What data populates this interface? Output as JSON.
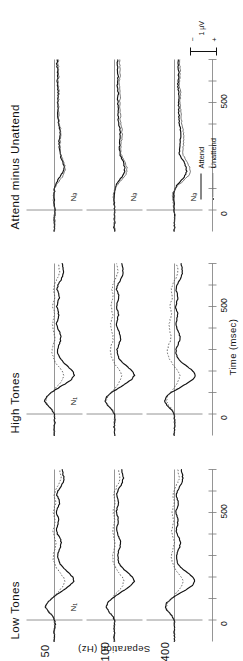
{
  "figure": {
    "title": "",
    "columns": [
      {
        "key": "low",
        "label": "Low Tones"
      },
      {
        "key": "high",
        "label": "High Tones"
      },
      {
        "key": "diff",
        "label": "Attend minus Unattend"
      }
    ],
    "row_axis_label": "Separation (Hz)",
    "rows": [
      {
        "key": "sep50",
        "label": "50"
      },
      {
        "key": "sep100",
        "label": "100"
      },
      {
        "key": "sep400",
        "label": "400"
      }
    ],
    "time_axis": {
      "label": "Time (msec)",
      "tick_labels": [
        "0",
        "500"
      ],
      "tick_values": [
        0,
        500
      ],
      "range": [
        -100,
        700
      ],
      "minor_tick_step": 100
    },
    "legend": {
      "position": "bottom-right",
      "items": [
        {
          "label": "Attend",
          "style": "solid"
        },
        {
          "label": "Unattend",
          "style": "dotted"
        }
      ]
    },
    "scale_bar": {
      "label": "1 µV",
      "plus": "+",
      "minus": "−"
    },
    "annotations": {
      "tone_component": "N₁",
      "diff_component": "Nₔ"
    },
    "colors": {
      "attend": "#111111",
      "unattend": "#555555",
      "axis": "#7a7a7a",
      "text": "#111111",
      "background": "#ffffff"
    }
  },
  "chart_data": {
    "type": "line",
    "xlabel": "Time (msec)",
    "ylabel": "Separation (Hz)",
    "xlim": [
      -100,
      700
    ],
    "ylim": [
      -4,
      4
    ],
    "grid": false,
    "legend": [
      "Attend",
      "Unattend"
    ],
    "legend_position": "bottom-right",
    "x_tick_labels": [
      "0",
      "500"
    ],
    "x_tick_values": [
      0,
      500
    ],
    "x": [
      -100,
      -80,
      -60,
      -40,
      -20,
      0,
      20,
      40,
      60,
      80,
      100,
      120,
      140,
      160,
      180,
      200,
      220,
      240,
      260,
      280,
      300,
      320,
      340,
      360,
      380,
      400,
      420,
      440,
      460,
      480,
      500,
      520,
      540,
      560,
      580,
      600,
      620,
      640,
      660,
      680,
      700
    ],
    "panels": [
      {
        "column": "Low Tones",
        "row": "50",
        "annotation": "N1",
        "series": [
          {
            "name": "Attend",
            "values": [
              0.05,
              -0.05,
              0.1,
              0.0,
              -0.1,
              0.0,
              0.35,
              0.9,
              1.3,
              1.05,
              0.4,
              -0.4,
              -1.3,
              -2.2,
              -2.75,
              -2.6,
              -2.0,
              -1.3,
              -0.8,
              -0.55,
              -0.45,
              -0.6,
              -0.85,
              -1.0,
              -0.8,
              -0.45,
              -0.3,
              -0.45,
              -0.6,
              -0.5,
              -0.3,
              -0.45,
              -0.7,
              -0.6,
              -0.35,
              -0.5,
              -0.9,
              -1.2,
              -1.35,
              -1.2,
              -1.1
            ]
          },
          {
            "name": "Unattend",
            "values": [
              0.0,
              0.05,
              0.0,
              -0.05,
              0.0,
              0.05,
              0.3,
              0.85,
              1.25,
              1.0,
              0.45,
              -0.2,
              -0.8,
              -1.3,
              -1.5,
              -1.25,
              -0.8,
              -0.35,
              -0.05,
              0.15,
              0.2,
              0.05,
              -0.15,
              -0.2,
              -0.05,
              0.15,
              0.2,
              0.05,
              -0.1,
              0.0,
              0.15,
              0.05,
              -0.15,
              -0.1,
              0.05,
              -0.1,
              -0.4,
              -0.75,
              -0.95,
              -0.85,
              -0.75
            ]
          }
        ]
      },
      {
        "column": "Low Tones",
        "row": "100",
        "annotation": "",
        "series": [
          {
            "name": "Attend",
            "values": [
              0.0,
              0.05,
              -0.05,
              0.05,
              0.0,
              0.0,
              0.3,
              0.85,
              1.2,
              1.0,
              0.35,
              -0.5,
              -1.45,
              -2.35,
              -2.8,
              -2.55,
              -1.9,
              -1.2,
              -0.7,
              -0.5,
              -0.45,
              -0.6,
              -0.8,
              -0.9,
              -0.7,
              -0.4,
              -0.3,
              -0.45,
              -0.55,
              -0.45,
              -0.25,
              -0.4,
              -0.6,
              -0.5,
              -0.3,
              -0.45,
              -0.8,
              -1.1,
              -1.25,
              -1.15,
              -1.05
            ]
          },
          {
            "name": "Unattend",
            "values": [
              0.0,
              0.0,
              0.05,
              0.0,
              -0.05,
              0.05,
              0.25,
              0.8,
              1.15,
              0.95,
              0.4,
              -0.15,
              -0.7,
              -1.15,
              -1.35,
              -1.1,
              -0.6,
              -0.2,
              0.05,
              0.25,
              0.3,
              0.15,
              -0.05,
              -0.1,
              0.05,
              0.2,
              0.25,
              0.1,
              -0.05,
              0.05,
              0.2,
              0.1,
              -0.1,
              -0.05,
              0.1,
              -0.05,
              -0.3,
              -0.6,
              -0.8,
              -0.7,
              -0.6
            ]
          }
        ]
      },
      {
        "column": "Low Tones",
        "row": "400",
        "annotation": "",
        "series": [
          {
            "name": "Attend",
            "values": [
              0.05,
              0.0,
              0.05,
              -0.05,
              0.0,
              0.05,
              0.35,
              0.95,
              1.35,
              1.1,
              0.4,
              -0.55,
              -1.6,
              -2.5,
              -2.9,
              -2.6,
              -1.85,
              -1.05,
              -0.5,
              -0.3,
              -0.3,
              -0.5,
              -0.75,
              -0.85,
              -0.65,
              -0.35,
              -0.25,
              -0.4,
              -0.5,
              -0.4,
              -0.2,
              -0.35,
              -0.55,
              -0.45,
              -0.25,
              -0.4,
              -0.75,
              -1.05,
              -1.2,
              -1.1,
              -1.0
            ]
          },
          {
            "name": "Unattend",
            "values": [
              0.0,
              0.05,
              0.0,
              0.0,
              -0.05,
              0.0,
              0.3,
              0.85,
              1.2,
              1.0,
              0.45,
              -0.1,
              -0.6,
              -1.0,
              -1.2,
              -0.95,
              -0.45,
              -0.05,
              0.2,
              0.4,
              0.45,
              0.3,
              0.1,
              0.05,
              0.2,
              0.35,
              0.4,
              0.25,
              0.1,
              0.2,
              0.35,
              0.25,
              0.05,
              0.1,
              0.25,
              0.1,
              -0.15,
              -0.45,
              -0.65,
              -0.55,
              -0.45
            ]
          }
        ]
      },
      {
        "column": "High Tones",
        "row": "50",
        "annotation": "N1",
        "series": [
          {
            "name": "Attend",
            "values": [
              0.0,
              0.05,
              0.0,
              -0.05,
              0.0,
              0.05,
              0.4,
              1.0,
              1.4,
              1.15,
              0.45,
              -0.5,
              -1.5,
              -2.4,
              -2.85,
              -2.6,
              -1.95,
              -1.25,
              -0.75,
              -0.5,
              -0.45,
              -0.6,
              -0.85,
              -0.95,
              -0.75,
              -0.4,
              -0.3,
              -0.45,
              -0.6,
              -0.5,
              -0.3,
              -0.45,
              -0.7,
              -0.6,
              -0.35,
              -0.5,
              -0.85,
              -1.15,
              -1.3,
              -1.2,
              -1.1
            ]
          },
          {
            "name": "Unattend",
            "values": [
              0.05,
              0.0,
              0.05,
              0.0,
              -0.05,
              0.05,
              0.3,
              0.85,
              1.25,
              1.0,
              0.45,
              -0.15,
              -0.7,
              -1.15,
              -1.35,
              -1.1,
              -0.6,
              -0.15,
              0.1,
              0.3,
              0.35,
              0.2,
              0.0,
              -0.05,
              0.1,
              0.25,
              0.3,
              0.15,
              0.0,
              0.1,
              0.25,
              0.15,
              -0.05,
              0.0,
              0.15,
              0.0,
              -0.25,
              -0.55,
              -0.75,
              -0.65,
              -0.55
            ]
          }
        ]
      },
      {
        "column": "High Tones",
        "row": "100",
        "annotation": "",
        "series": [
          {
            "name": "Attend",
            "values": [
              0.0,
              0.0,
              0.05,
              0.0,
              -0.05,
              0.0,
              0.35,
              0.95,
              1.35,
              1.1,
              0.4,
              -0.55,
              -1.55,
              -2.45,
              -2.85,
              -2.55,
              -1.85,
              -1.1,
              -0.6,
              -0.4,
              -0.35,
              -0.55,
              -0.8,
              -0.9,
              -0.7,
              -0.4,
              -0.3,
              -0.45,
              -0.55,
              -0.45,
              -0.25,
              -0.4,
              -0.65,
              -0.55,
              -0.3,
              -0.45,
              -0.8,
              -1.1,
              -1.25,
              -1.15,
              -1.05
            ]
          },
          {
            "name": "Unattend",
            "values": [
              0.0,
              0.05,
              0.0,
              0.05,
              0.0,
              0.0,
              0.3,
              0.85,
              1.2,
              1.0,
              0.5,
              -0.05,
              -0.5,
              -0.85,
              -1.05,
              -0.8,
              -0.3,
              0.1,
              0.35,
              0.55,
              0.6,
              0.45,
              0.25,
              0.2,
              0.35,
              0.5,
              0.55,
              0.4,
              0.25,
              0.35,
              0.5,
              0.4,
              0.2,
              0.25,
              0.4,
              0.25,
              0.0,
              -0.3,
              -0.5,
              -0.4,
              -0.3
            ]
          }
        ]
      },
      {
        "column": "High Tones",
        "row": "400",
        "annotation": "",
        "series": [
          {
            "name": "Attend",
            "values": [
              0.05,
              0.0,
              0.0,
              -0.05,
              0.0,
              0.05,
              0.4,
              1.05,
              1.45,
              1.2,
              0.45,
              -0.6,
              -1.7,
              -2.6,
              -3.0,
              -2.65,
              -1.85,
              -1.0,
              -0.45,
              -0.25,
              -0.25,
              -0.45,
              -0.7,
              -0.8,
              -0.6,
              -0.3,
              -0.2,
              -0.35,
              -0.45,
              -0.35,
              -0.15,
              -0.3,
              -0.5,
              -0.4,
              -0.2,
              -0.35,
              -0.7,
              -1.0,
              -1.15,
              -1.05,
              -0.95
            ]
          },
          {
            "name": "Unattend",
            "values": [
              0.0,
              0.0,
              0.05,
              0.0,
              0.0,
              0.0,
              0.3,
              0.85,
              1.2,
              1.0,
              0.55,
              0.1,
              -0.3,
              -0.6,
              -0.75,
              -0.5,
              0.0,
              0.45,
              0.75,
              0.95,
              1.0,
              0.85,
              0.6,
              0.5,
              0.6,
              0.75,
              0.8,
              0.6,
              0.4,
              0.5,
              0.65,
              0.5,
              0.3,
              0.35,
              0.5,
              0.3,
              0.0,
              -0.3,
              -0.5,
              -0.4,
              -0.3
            ]
          }
        ]
      },
      {
        "column": "Attend minus Unattend",
        "row": "50",
        "annotation": "Nd",
        "series": [
          {
            "name": "Low",
            "values": [
              0.05,
              -0.05,
              0.1,
              0.05,
              -0.05,
              -0.05,
              0.05,
              0.05,
              0.05,
              0.05,
              -0.05,
              -0.2,
              -0.5,
              -0.9,
              -1.25,
              -1.35,
              -1.2,
              -0.95,
              -0.85,
              -0.7,
              -0.65,
              -0.65,
              -0.7,
              -0.8,
              -0.75,
              -0.6,
              -0.5,
              -0.5,
              -0.5,
              -0.5,
              -0.45,
              -0.5,
              -0.55,
              -0.5,
              -0.4,
              -0.4,
              -0.5,
              -0.45,
              -0.4,
              -0.35,
              -0.35
            ]
          },
          {
            "name": "High",
            "values": [
              -0.05,
              0.05,
              -0.05,
              -0.05,
              0.05,
              0.0,
              0.1,
              0.15,
              0.15,
              0.15,
              0.0,
              -0.35,
              -0.8,
              -1.25,
              -1.5,
              -1.5,
              -1.35,
              -1.1,
              -0.85,
              -0.8,
              -0.8,
              -0.8,
              -0.85,
              -0.9,
              -0.85,
              -0.65,
              -0.6,
              -0.6,
              -0.6,
              -0.6,
              -0.55,
              -0.6,
              -0.65,
              -0.6,
              -0.5,
              -0.5,
              -0.6,
              -0.6,
              -0.55,
              -0.55,
              -0.55
            ]
          }
        ]
      },
      {
        "column": "Attend minus Unattend",
        "row": "100",
        "annotation": "Nd",
        "series": [
          {
            "name": "Low",
            "values": [
              0.0,
              0.05,
              -0.05,
              0.05,
              0.0,
              -0.05,
              0.05,
              0.05,
              0.05,
              0.05,
              -0.05,
              -0.35,
              -0.75,
              -1.2,
              -1.45,
              -1.45,
              -1.3,
              -1.0,
              -0.75,
              -0.75,
              -0.75,
              -0.75,
              -0.75,
              -0.8,
              -0.75,
              -0.6,
              -0.55,
              -0.55,
              -0.5,
              -0.5,
              -0.45,
              -0.5,
              -0.5,
              -0.45,
              -0.4,
              -0.4,
              -0.5,
              -0.5,
              -0.45,
              -0.45,
              -0.45
            ]
          },
          {
            "name": "High",
            "values": [
              0.0,
              -0.05,
              0.05,
              0.0,
              -0.05,
              0.0,
              0.05,
              0.1,
              0.15,
              0.1,
              -0.1,
              -0.5,
              -1.05,
              -1.6,
              -1.8,
              -1.75,
              -1.55,
              -1.2,
              -0.95,
              -0.95,
              -0.95,
              -1.0,
              -1.05,
              -1.1,
              -1.05,
              -0.9,
              -0.85,
              -0.85,
              -0.8,
              -0.8,
              -0.75,
              -0.8,
              -0.85,
              -0.8,
              -0.7,
              -0.7,
              -0.8,
              -0.8,
              -0.75,
              -0.75,
              -0.75
            ]
          }
        ]
      },
      {
        "column": "Attend minus Unattend",
        "row": "400",
        "annotation": "Nd",
        "series": [
          {
            "name": "Low",
            "values": [
              0.05,
              0.0,
              0.05,
              -0.05,
              0.05,
              0.05,
              0.05,
              0.1,
              0.15,
              0.1,
              -0.05,
              -0.45,
              -1.0,
              -1.5,
              -1.7,
              -1.65,
              -1.4,
              -1.0,
              -0.7,
              -0.7,
              -0.75,
              -0.8,
              -0.85,
              -0.9,
              -0.85,
              -0.7,
              -0.65,
              -0.65,
              -0.6,
              -0.6,
              -0.55,
              -0.6,
              -0.6,
              -0.55,
              -0.5,
              -0.5,
              -0.6,
              -0.6,
              -0.55,
              -0.55,
              -0.55
            ]
          },
          {
            "name": "High",
            "values": [
              0.0,
              0.05,
              0.0,
              0.0,
              -0.05,
              0.05,
              0.1,
              0.2,
              0.25,
              0.2,
              -0.1,
              -0.7,
              -1.4,
              -2.0,
              -2.25,
              -2.15,
              -1.85,
              -1.45,
              -1.2,
              -1.2,
              -1.25,
              -1.3,
              -1.3,
              -1.3,
              -1.2,
              -1.05,
              -1.0,
              -0.95,
              -0.85,
              -0.85,
              -0.8,
              -0.85,
              -0.85,
              -0.8,
              -0.7,
              -0.7,
              -0.8,
              -0.8,
              -0.75,
              -0.75,
              -0.75
            ]
          }
        ]
      }
    ]
  }
}
